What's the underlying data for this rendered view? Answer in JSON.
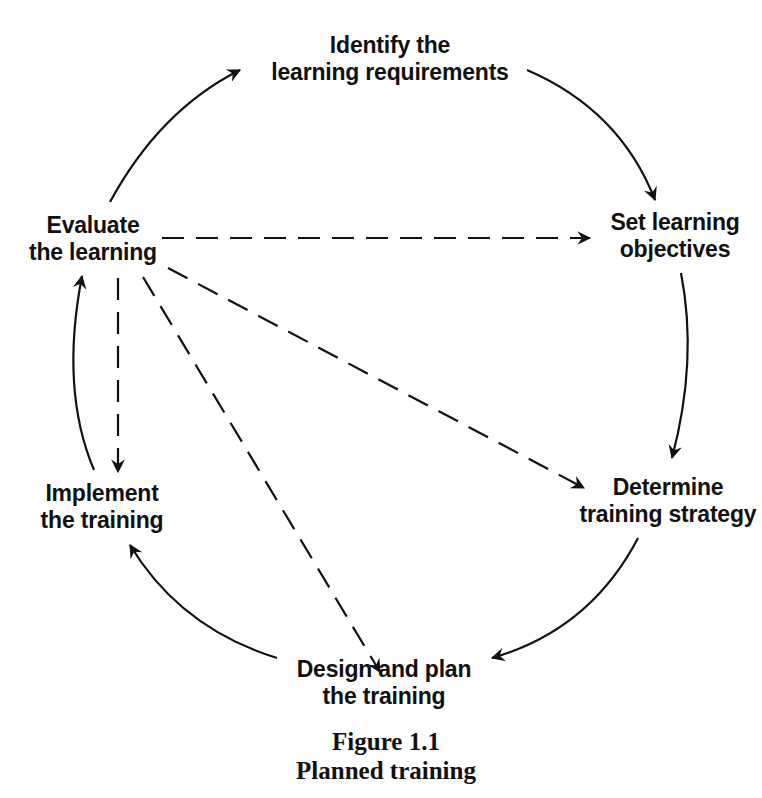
{
  "diagram": {
    "type": "cycle",
    "nodes": [
      {
        "id": "identify",
        "lines": [
          "Identify the",
          "learning requirements"
        ]
      },
      {
        "id": "objectives",
        "lines": [
          "Set learning",
          "objectives"
        ]
      },
      {
        "id": "strategy",
        "lines": [
          "Determine",
          "training strategy"
        ]
      },
      {
        "id": "design",
        "lines": [
          "Design and plan",
          "the training"
        ]
      },
      {
        "id": "implement",
        "lines": [
          "Implement",
          "the training"
        ]
      },
      {
        "id": "evaluate",
        "lines": [
          "Evaluate",
          "the learning"
        ]
      }
    ],
    "solid_edges": [
      {
        "from": "evaluate",
        "to": "identify"
      },
      {
        "from": "identify",
        "to": "objectives"
      },
      {
        "from": "objectives",
        "to": "strategy"
      },
      {
        "from": "strategy",
        "to": "design"
      },
      {
        "from": "design",
        "to": "implement"
      },
      {
        "from": "implement",
        "to": "evaluate"
      }
    ],
    "dashed_edges": [
      {
        "from": "evaluate",
        "to": "objectives"
      },
      {
        "from": "evaluate",
        "to": "strategy"
      },
      {
        "from": "evaluate",
        "to": "design"
      },
      {
        "from": "evaluate",
        "to": "implement"
      }
    ],
    "colors": {
      "ink": "#111111",
      "background": "#ffffff"
    }
  },
  "caption": {
    "figure_number": "Figure 1.1",
    "title": "Planned training"
  }
}
